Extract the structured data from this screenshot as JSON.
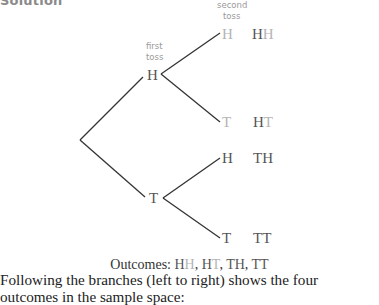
{
  "heading": "Solution",
  "tree": {
    "first_toss_label": [
      "first",
      "toss"
    ],
    "second_toss_label": [
      "second",
      "toss"
    ],
    "first_level": [
      {
        "label": "H",
        "branches": [
          {
            "label": "H",
            "outcome": "HH"
          },
          {
            "label": "T",
            "outcome": "HT"
          }
        ]
      },
      {
        "label": "T",
        "branches": [
          {
            "label": "H",
            "outcome": "TH"
          },
          {
            "label": "T",
            "outcome": "TT"
          }
        ]
      }
    ]
  },
  "caption": {
    "prefix": "Outcomes: ",
    "outcomes": [
      "HH",
      "HT",
      "TH",
      "TT"
    ]
  },
  "paragraph": "Following the branches (left to right) shows the four outcomes in the sample space:",
  "colors": {
    "dark_letter": "#555555",
    "light_letter": "#b4b4b4",
    "line": "#333333"
  }
}
